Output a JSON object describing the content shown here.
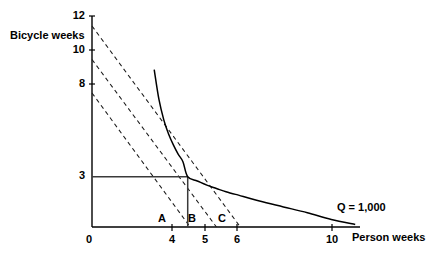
{
  "chart_data": {
    "type": "line",
    "title": "",
    "xlabel": "Person weeks",
    "ylabel": "Bicycle weeks",
    "xlim": [
      0,
      11.2
    ],
    "ylim": [
      0,
      12.6
    ],
    "grid": false,
    "legend_position": "inline-right",
    "x_ticks": [
      {
        "value": 0,
        "label": "0"
      },
      {
        "value": 4,
        "label": "4"
      },
      {
        "value": 5,
        "label": "5"
      },
      {
        "value": 6,
        "label": "6"
      },
      {
        "value": 10,
        "label": "10"
      }
    ],
    "y_ticks": [
      {
        "value": 3,
        "label": "3"
      },
      {
        "value": 8,
        "label": "8"
      },
      {
        "value": 10,
        "label": "10"
      },
      {
        "value": 12,
        "label": "12"
      }
    ],
    "series": [
      {
        "name": "Q = 1,000",
        "style": "solid",
        "type": "isoquant",
        "description": "Isoquant curve x*y = 12",
        "constant": 12,
        "x_start": 2.6,
        "x_end": 11.0,
        "points": [
          {
            "x": 2.6,
            "y": 9.4
          },
          {
            "x": 2.8,
            "y": 7.6
          },
          {
            "x": 3.0,
            "y": 6.4
          },
          {
            "x": 3.2,
            "y": 5.55
          },
          {
            "x": 3.4,
            "y": 4.9
          },
          {
            "x": 3.6,
            "y": 4.35
          },
          {
            "x": 3.8,
            "y": 3.9
          },
          {
            "x": 4.0,
            "y": 3.0
          },
          {
            "x": 4.4,
            "y": 2.75
          },
          {
            "x": 4.8,
            "y": 2.5
          },
          {
            "x": 5.2,
            "y": 2.3
          },
          {
            "x": 5.6,
            "y": 2.1
          },
          {
            "x": 6.0,
            "y": 1.95
          },
          {
            "x": 7.0,
            "y": 1.55
          },
          {
            "x": 8.0,
            "y": 1.2
          },
          {
            "x": 9.0,
            "y": 0.85
          },
          {
            "x": 10.0,
            "y": 0.45
          },
          {
            "x": 11.0,
            "y": 0.15
          }
        ]
      },
      {
        "name": "isocost-A",
        "style": "dashed",
        "type": "budget-line",
        "from": {
          "x": 0,
          "y": 8
        },
        "to": {
          "x": 4.1,
          "y": 0
        }
      },
      {
        "name": "isocost-B",
        "style": "dashed",
        "type": "budget-line",
        "from": {
          "x": 0,
          "y": 10
        },
        "to": {
          "x": 5.2,
          "y": 0
        }
      },
      {
        "name": "isocost-C",
        "style": "dashed",
        "type": "budget-line",
        "from": {
          "x": 0,
          "y": 12
        },
        "to": {
          "x": 6.2,
          "y": 0
        }
      }
    ],
    "guide_rectangle": {
      "name": "optimum-rectangle",
      "x": 4,
      "y": 3,
      "description": "Solid rectangle from origin to the tangency point (4, 3)"
    },
    "annotations": [
      {
        "name": "point-a",
        "label": "A",
        "x": 3.75,
        "y": 0.35
      },
      {
        "name": "point-b",
        "label": "B",
        "x": 4.85,
        "y": 0.35
      },
      {
        "name": "point-c",
        "label": "C",
        "x": 5.9,
        "y": 0.35
      },
      {
        "name": "isoquant-label",
        "label": "Q = 1,000",
        "x": 12.0,
        "y": 1.15
      }
    ]
  },
  "axis": {
    "x_label": "Person weeks",
    "y_label": "Bicycle weeks"
  },
  "labels": {
    "y_12": "12",
    "y_10": "10",
    "y_8": "8",
    "y_3": "3",
    "x_0": "0",
    "x_4": "4",
    "x_5": "5",
    "x_6": "6",
    "x_10": "10",
    "point_a": "A",
    "point_b": "B",
    "point_c": "C",
    "q_label": "Q = 1,000"
  },
  "colors": {
    "ink": "#000000",
    "background": "#ffffff",
    "guide": "#3a3a3a"
  }
}
